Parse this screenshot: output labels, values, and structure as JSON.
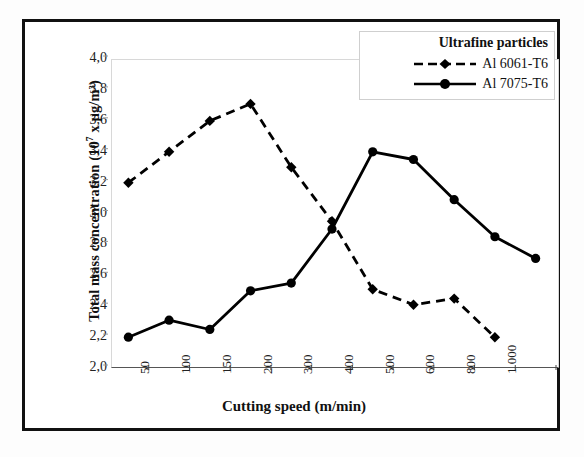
{
  "chart_data": {
    "type": "line",
    "title": "",
    "xlabel": "Cutting speed (m/min)",
    "ylabel": "Total mass concentration (10⁷ x µg/m³)",
    "ylabel_prefix": "Total mass concentration (10",
    "ylabel_exponent": "7",
    "ylabel_suffix": " x µg/m³)",
    "categories": [
      "50",
      "100",
      "150",
      "200",
      "300",
      "400",
      "500",
      "600",
      "800",
      "1 000",
      ""
    ],
    "ytick_labels": [
      "4,0",
      "3,8",
      "3,6",
      "3,4",
      "3,2",
      "3,0",
      "2,8",
      "2,6",
      "2,4",
      "2,2",
      "2,0"
    ],
    "ylim": [
      2.0,
      4.0
    ],
    "ytick_step": 0.2,
    "grid": false,
    "legend_position": "top-right",
    "legend_title": "Ultrafine particles",
    "series": [
      {
        "name": "Al 6061-T6",
        "style": "dashed",
        "marker": "diamond",
        "color": "#000000",
        "values": [
          3.18,
          3.38,
          3.58,
          3.69,
          3.28,
          2.93,
          2.49,
          2.39,
          2.43,
          2.18,
          null
        ]
      },
      {
        "name": "Al 7075-T6",
        "style": "solid",
        "marker": "circle",
        "color": "#000000",
        "values": [
          2.18,
          2.29,
          2.23,
          2.48,
          2.53,
          2.88,
          3.38,
          3.33,
          3.07,
          2.83,
          2.69
        ]
      }
    ]
  },
  "legend": {
    "title": "Ultrafine particles",
    "items": [
      {
        "label": "Al 6061-T6",
        "marker": "diamond",
        "style": "dashed"
      },
      {
        "label": "Al 7075-T6",
        "marker": "circle",
        "style": "solid"
      }
    ]
  },
  "axes": {
    "x_title": "Cutting speed (m/min)",
    "y_title": "Total mass concentration (10⁷ x µg/m³)"
  }
}
